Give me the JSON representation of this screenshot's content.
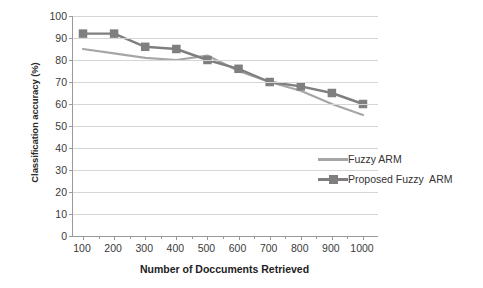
{
  "chart_data": {
    "type": "line",
    "title": "",
    "xlabel": "Number of Doccuments Retrieved",
    "ylabel": "Classification accuracy (%)",
    "categories": [
      "100",
      "200",
      "300",
      "400",
      "500",
      "600",
      "700",
      "800",
      "900",
      "1000"
    ],
    "xticklabels": [
      "100",
      "200",
      "300",
      "400",
      "500",
      "600",
      "700",
      "800",
      "900",
      "1000"
    ],
    "yticklabels": [
      "100",
      "90",
      "80",
      "70",
      "60",
      "50",
      "40",
      "30",
      "20",
      "10",
      "0"
    ],
    "ylim": [
      0,
      100
    ],
    "ytick_step": 10,
    "grid": "horizontal",
    "legend_position": "center-right-inside",
    "series": [
      {
        "name": "Fuzzy ARM",
        "color": "#a6a6a6",
        "marker": "none",
        "values": [
          85,
          83,
          81,
          80,
          82,
          75,
          70,
          66,
          60,
          55
        ]
      },
      {
        "name": "Proposed Fuzzy  ARM",
        "color": "#7f7f7f",
        "marker": "square",
        "values": [
          92,
          92,
          86,
          85,
          80,
          76,
          70,
          68,
          65,
          60
        ]
      }
    ]
  },
  "legend": {
    "items": [
      {
        "label": "Fuzzy ARM"
      },
      {
        "label": "Proposed Fuzzy  ARM"
      }
    ]
  },
  "colors": {
    "series_fuzzy_arm": "#a6a6a6",
    "series_proposed_fuzzy_arm": "#7f7f7f",
    "gridline": "#d6d6d6",
    "axis": "#9a9a9a",
    "background": "#ffffff"
  }
}
